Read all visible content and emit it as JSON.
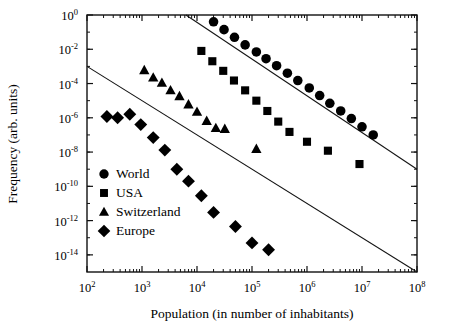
{
  "chart_data": {
    "type": "scatter",
    "title": "",
    "xlabel": "Population (in number of inhabitants)",
    "ylabel": "Frequency (arb. units)",
    "xscale": "log",
    "yscale": "log",
    "xlim": [
      100,
      100000000
    ],
    "ylim": [
      1e-15,
      1
    ],
    "grid": false,
    "legend_position": "lower-left-inside",
    "xticks": [
      {
        "value": 100,
        "label": "10",
        "exponent": "2"
      },
      {
        "value": 1000,
        "label": "10",
        "exponent": "3"
      },
      {
        "value": 10000,
        "label": "10",
        "exponent": "4"
      },
      {
        "value": 100000,
        "label": "10",
        "exponent": "5"
      },
      {
        "value": 1000000,
        "label": "10",
        "exponent": "6"
      },
      {
        "value": 10000000,
        "label": "10",
        "exponent": "7"
      },
      {
        "value": 100000000,
        "label": "10",
        "exponent": "8"
      }
    ],
    "yticks": [
      {
        "value": 1.0,
        "label": "10",
        "exponent": "0"
      },
      {
        "value": 0.01,
        "label": "10",
        "exponent": "-2"
      },
      {
        "value": 0.0001,
        "label": "10",
        "exponent": "-4"
      },
      {
        "value": 1e-06,
        "label": "10",
        "exponent": "-6"
      },
      {
        "value": 1e-08,
        "label": "10",
        "exponent": "-8"
      },
      {
        "value": 1e-10,
        "label": "10",
        "exponent": "-10"
      },
      {
        "value": 1e-12,
        "label": "10",
        "exponent": "-12"
      },
      {
        "value": 1e-14,
        "label": "10",
        "exponent": "-14"
      }
    ],
    "series": [
      {
        "name": "World",
        "marker": "circle",
        "color": "#000000",
        "points": [
          [
            20000.0,
            0.4
          ],
          [
            31000.0,
            0.14
          ],
          [
            48000.0,
            0.05
          ],
          [
            75000.0,
            0.018
          ],
          [
            120000.0,
            0.007
          ],
          [
            180000.0,
            0.0028
          ],
          [
            280000.0,
            0.0011
          ],
          [
            440000.0,
            0.0004
          ],
          [
            680000.0,
            0.00015
          ],
          [
            1100000.0,
            5.5e-05
          ],
          [
            1700000.0,
            2e-05
          ],
          [
            2600000.0,
            7e-06
          ],
          [
            4100000.0,
            2.5e-06
          ],
          [
            6400000.0,
            9e-07
          ],
          [
            10000000.0,
            3e-07
          ],
          [
            16000000.0,
            1e-07
          ]
        ]
      },
      {
        "name": "USA",
        "marker": "square",
        "color": "#000000",
        "points": [
          [
            12000.0,
            0.008
          ],
          [
            19000.0,
            0.002
          ],
          [
            30000.0,
            0.00055
          ],
          [
            47000.0,
            0.00015
          ],
          [
            75000.0,
            4e-05
          ],
          [
            120000.0,
            1e-05
          ],
          [
            190000.0,
            2.5e-06
          ],
          [
            300000.0,
            6e-07
          ],
          [
            480000.0,
            1.5e-07
          ],
          [
            1000000.0,
            4e-08
          ],
          [
            2400000.0,
            1.2e-08
          ],
          [
            9000000.0,
            2e-09
          ]
        ]
      },
      {
        "name": "Switzerland",
        "marker": "triangle",
        "color": "#000000",
        "points": [
          [
            1100.0,
            0.0006
          ],
          [
            1600.0,
            0.00022
          ],
          [
            2300.0,
            0.00011
          ],
          [
            3300.0,
            4e-05
          ],
          [
            4800.0,
            1.8e-05
          ],
          [
            7000.0,
            6e-06
          ],
          [
            10000.0,
            2.2e-06
          ],
          [
            15000.0,
            6.5e-07
          ],
          [
            22000.0,
            2.5e-07
          ],
          [
            32000.0,
            2.2e-07
          ],
          [
            120000.0,
            1.5e-08
          ]
        ]
      },
      {
        "name": "Europe",
        "marker": "diamond",
        "color": "#000000",
        "points": [
          [
            230.0,
            1.2e-06
          ],
          [
            360.0,
            1e-06
          ],
          [
            600.0,
            1.6e-06
          ],
          [
            950.0,
            4e-07
          ],
          [
            1600.0,
            7e-08
          ],
          [
            2600.0,
            1.3e-08
          ],
          [
            4300.0,
            1e-09
          ],
          [
            7000.0,
            2e-10
          ],
          [
            12000.0,
            2.8e-11
          ],
          [
            20000.0,
            3e-12
          ],
          [
            50000.0,
            4.5e-13
          ],
          [
            100000.0,
            5e-14
          ],
          [
            200000.0,
            2e-14
          ]
        ]
      }
    ],
    "trend_lines": [
      {
        "name": "upper-power-law",
        "from": [
          6300,
          1.0
        ],
        "to": [
          100000000,
          1e-09
        ]
      },
      {
        "name": "lower-power-law",
        "from": [
          100,
          0.001
        ],
        "to": [
          100000000,
          1e-15
        ]
      }
    ]
  },
  "legend": {
    "entries": [
      {
        "label": "World",
        "marker": "circle"
      },
      {
        "label": "USA",
        "marker": "square"
      },
      {
        "label": "Switzerland",
        "marker": "triangle"
      },
      {
        "label": "Europe",
        "marker": "diamond"
      }
    ]
  }
}
